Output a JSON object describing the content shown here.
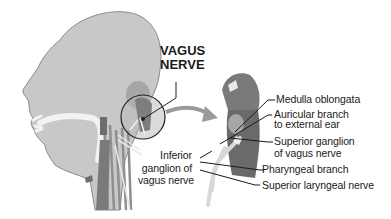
{
  "diagram": {
    "title_line1": "VAGUS",
    "title_line2": "NERVE",
    "labels": {
      "medulla": "Medulla oblongata",
      "auricular_line1": "Auricular branch",
      "auricular_line2": "to external ear",
      "superior_ganglion_line1": "Superior ganglion",
      "superior_ganglion_line2": "of vagus nerve",
      "inferior_ganglion_line1": "Inferior",
      "inferior_ganglion_line2": "ganglion of",
      "inferior_ganglion_line3": "vagus nerve",
      "pharyngeal": "Pharyngeal branch",
      "superior_laryngeal": "Superior laryngeal nerve"
    },
    "colors": {
      "head_fill": "#c8c8c8",
      "head_stroke": "#7a7a7a",
      "nerve_white": "#f2f2f2",
      "structure_dark": "#6e6e6e",
      "line": "#1a1a1a"
    }
  }
}
